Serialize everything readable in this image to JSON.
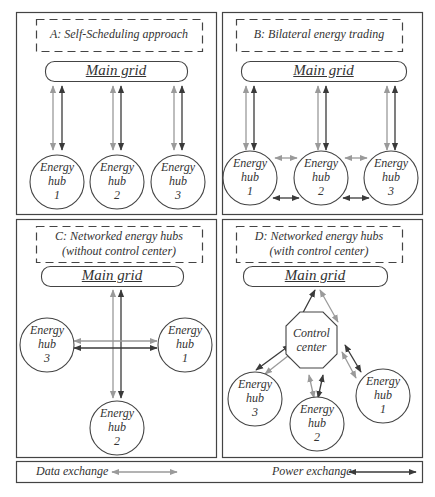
{
  "panels": [
    {
      "id": "A",
      "title_line1": "A: Self-Scheduling approach",
      "title_line2": "",
      "grid_label": "Main grid",
      "hubs": [
        {
          "line1": "Energy",
          "line2": "hub",
          "line3": "1"
        },
        {
          "line1": "Energy",
          "line2": "hub",
          "line3": "2"
        },
        {
          "line1": "Energy",
          "line2": "hub",
          "line3": "3"
        }
      ]
    },
    {
      "id": "B",
      "title_line1": "B: Bilateral energy trading",
      "title_line2": "",
      "grid_label": "Main grid",
      "hubs": [
        {
          "line1": "Energy",
          "line2": "hub",
          "line3": "1"
        },
        {
          "line1": "Energy",
          "line2": "hub",
          "line3": "2"
        },
        {
          "line1": "Energy",
          "line2": "hub",
          "line3": "3"
        }
      ]
    },
    {
      "id": "C",
      "title_line1": "C: Networked energy hubs",
      "title_line2": "(without control center)",
      "grid_label": "Main grid",
      "hubs": [
        {
          "line1": "Energy",
          "line2": "hub",
          "line3": "3"
        },
        {
          "line1": "Energy",
          "line2": "hub",
          "line3": "1"
        },
        {
          "line1": "Energy",
          "line2": "hub",
          "line3": "2"
        }
      ]
    },
    {
      "id": "D",
      "title_line1": "D: Networked energy hubs",
      "title_line2": "(with control center)",
      "grid_label": "Main grid",
      "control_center": {
        "line1": "Control",
        "line2": "center"
      },
      "hubs": [
        {
          "line1": "Energy",
          "line2": "hub",
          "line3": "3"
        },
        {
          "line1": "Energy",
          "line2": "hub",
          "line3": "2"
        },
        {
          "line1": "Energy",
          "line2": "hub",
          "line3": "1"
        }
      ]
    }
  ],
  "legend": {
    "data_label": "Data exchange",
    "power_label": "Power exchange"
  },
  "colors": {
    "data_arrow": "#9a9a9a",
    "power_arrow": "#3a3a3a",
    "border": "#444444"
  }
}
